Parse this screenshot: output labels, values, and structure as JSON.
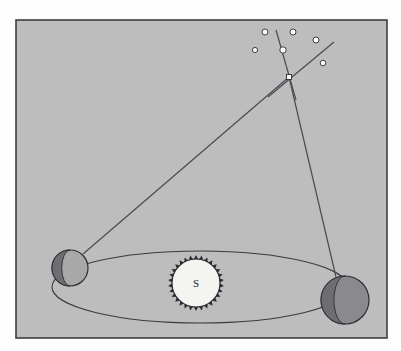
{
  "figure": {
    "kind": "stellar-parallax-diagram",
    "background_color": "#fdfdfd",
    "panel_fill": "#bdbdbd",
    "panel_border_color": "#3c3c44",
    "line_color": "#4a4a54",
    "panel": {
      "x": 16,
      "y": 20,
      "width": 371,
      "height": 318
    }
  },
  "sun": {
    "label": "S",
    "center_x": 196,
    "center_y": 283,
    "radius": 24,
    "spike_radius": 28,
    "spike_count": 30,
    "fill": "#f4f4f0",
    "edge_color": "#2d2d33"
  },
  "orbit": {
    "name": "earth-orbit-ellipse",
    "center_x": 200,
    "center_y": 287,
    "rx": 148,
    "ry": 36,
    "stroke": "#3a3a42",
    "stroke_width": 1.1
  },
  "earth_positions": [
    {
      "id": "earth-position-left",
      "label": "",
      "center_x": 70,
      "center_y": 268,
      "radius": 18,
      "lit_fill": "#a8a8a8",
      "dark_fill": "#6e6e72",
      "edge_color": "#2d2d33",
      "terminator_side": "left"
    },
    {
      "id": "earth-position-right",
      "label": "",
      "center_x": 345,
      "center_y": 300,
      "radius": 24,
      "lit_fill": "#8a8a8e",
      "dark_fill": "#6e6e72",
      "edge_color": "#2d2d33",
      "terminator_side": "left"
    }
  ],
  "target_star": {
    "id": "target-star",
    "center_x": 289,
    "center_y": 77,
    "size": 5,
    "fill": "#fbfbfb",
    "edge_color": "#2d2d33"
  },
  "sight_lines": [
    {
      "id": "sight-line-left",
      "x1": 83,
      "y1": 254,
      "x2": 289,
      "y2": 77,
      "stroke": "#4a4a54",
      "stroke_width": 1.2
    },
    {
      "id": "sight-line-right",
      "x1": 336,
      "y1": 277,
      "x2": 289,
      "y2": 77,
      "stroke": "#4a4a54",
      "stroke_width": 1.2
    }
  ],
  "reference_lines": [
    {
      "id": "reference-line-steep",
      "x1": 276,
      "y1": 30,
      "x2": 296,
      "y2": 100,
      "stroke": "#4a4a54",
      "stroke_width": 1.2
    },
    {
      "id": "reference-line-diagonal",
      "x1": 334,
      "y1": 42,
      "x2": 268,
      "y2": 97,
      "stroke": "#4a4a54",
      "stroke_width": 1.2
    }
  ],
  "background_stars": [
    {
      "id": "background-star-1",
      "cx": 265,
      "cy": 32,
      "r": 3
    },
    {
      "id": "background-star-2",
      "cx": 293,
      "cy": 32,
      "r": 3
    },
    {
      "id": "background-star-3",
      "cx": 255,
      "cy": 50,
      "r": 2.6
    },
    {
      "id": "background-star-4",
      "cx": 316,
      "cy": 40,
      "r": 3
    },
    {
      "id": "background-star-5",
      "cx": 323,
      "cy": 63,
      "r": 2.8
    },
    {
      "id": "background-star-on-line",
      "cx": 283,
      "cy": 50,
      "r": 3.2
    }
  ],
  "star_style": {
    "fill": "#fbfbfb",
    "edge_color": "#2d2d33",
    "edge_width": 0.9
  }
}
